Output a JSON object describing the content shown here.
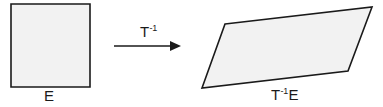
{
  "figure": {
    "background_color": "#ffffff",
    "shape_fill_color": "#f2f2f2",
    "shape_stroke_color": "#1a1a1a",
    "text_color": "#1a1a1a",
    "source_shape": {
      "name": "square",
      "label_base": "E",
      "label_superscript": "",
      "points": "11,4 90,4 90,87 11,87"
    },
    "transform_arrow": {
      "name": "arrow-right",
      "label_base": "T",
      "label_superscript": "-1",
      "line_x1": 114,
      "line_y1": 46,
      "line_x2": 175,
      "line_y2": 46,
      "head_points": "181,46 170,41 170,51"
    },
    "image_shape": {
      "name": "parallelogram",
      "label_base": "E",
      "label_superscript": "-1",
      "label_prefix": "T",
      "points": "225,24 372,7 348,71 202,88"
    }
  }
}
